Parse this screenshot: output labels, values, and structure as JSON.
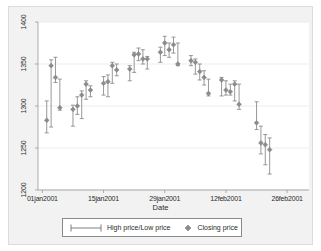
{
  "chart_data": {
    "type": "line",
    "title": "",
    "xlabel": "Date",
    "ylabel": "",
    "ylim": [
      1200,
      1400
    ],
    "yticks": [
      1200,
      1250,
      1300,
      1350,
      1400
    ],
    "xticks": [
      "01jan2001",
      "15jan2001",
      "29jan2001",
      "12feb2001",
      "26feb2001"
    ],
    "xtick_days": [
      0,
      14,
      28,
      42,
      56
    ],
    "xlim_days": [
      -1,
      61
    ],
    "grid": "horizontal",
    "legend_position": "bottom",
    "series": [
      {
        "name": "High price/Low price",
        "type": "range-bar",
        "color": "#8c8c8c",
        "marker": "capped-line"
      },
      {
        "name": "Closing price",
        "type": "marker",
        "color": "#8c8c8c",
        "marker": "diamond"
      }
    ],
    "points": [
      {
        "day": 1,
        "date": "02jan2001",
        "high": 1306,
        "low": 1268,
        "close": 1283
      },
      {
        "day": 2,
        "date": "03jan2001",
        "high": 1355,
        "low": 1275,
        "close": 1348
      },
      {
        "day": 3,
        "date": "04jan2001",
        "high": 1358,
        "low": 1328,
        "close": 1334
      },
      {
        "day": 4,
        "date": "05jan2001",
        "high": 1332,
        "low": 1295,
        "close": 1298
      },
      {
        "day": 7,
        "date": "08jan2001",
        "high": 1301,
        "low": 1276,
        "close": 1296
      },
      {
        "day": 8,
        "date": "09jan2001",
        "high": 1311,
        "low": 1290,
        "close": 1300
      },
      {
        "day": 9,
        "date": "10jan2001",
        "high": 1318,
        "low": 1285,
        "close": 1313
      },
      {
        "day": 10,
        "date": "11jan2001",
        "high": 1330,
        "low": 1308,
        "close": 1326
      },
      {
        "day": 11,
        "date": "12jan2001",
        "high": 1324,
        "low": 1311,
        "close": 1319
      },
      {
        "day": 14,
        "date": "16jan2001",
        "high": 1335,
        "low": 1313,
        "close": 1327
      },
      {
        "day": 15,
        "date": "17jan2001",
        "high": 1337,
        "low": 1311,
        "close": 1329
      },
      {
        "day": 16,
        "date": "18jan2001",
        "high": 1352,
        "low": 1327,
        "close": 1348
      },
      {
        "day": 17,
        "date": "19jan2001",
        "high": 1350,
        "low": 1336,
        "close": 1343
      },
      {
        "day": 20,
        "date": "22jan2001",
        "high": 1348,
        "low": 1330,
        "close": 1344
      },
      {
        "day": 21,
        "date": "23jan2001",
        "high": 1364,
        "low": 1340,
        "close": 1361
      },
      {
        "day": 22,
        "date": "24jan2001",
        "high": 1369,
        "low": 1354,
        "close": 1362
      },
      {
        "day": 23,
        "date": "25jan2001",
        "high": 1367,
        "low": 1350,
        "close": 1356
      },
      {
        "day": 24,
        "date": "26jan2001",
        "high": 1359,
        "low": 1344,
        "close": 1356
      },
      {
        "day": 27,
        "date": "29jan2001",
        "high": 1370,
        "low": 1352,
        "close": 1364
      },
      {
        "day": 28,
        "date": "30jan2001",
        "high": 1383,
        "low": 1360,
        "close": 1375
      },
      {
        "day": 29,
        "date": "31jan2001",
        "high": 1375,
        "low": 1358,
        "close": 1367
      },
      {
        "day": 30,
        "date": "01feb2001",
        "high": 1382,
        "low": 1363,
        "close": 1373
      },
      {
        "day": 31,
        "date": "02feb2001",
        "high": 1375,
        "low": 1348,
        "close": 1350
      },
      {
        "day": 34,
        "date": "05feb2001",
        "high": 1360,
        "low": 1348,
        "close": 1354
      },
      {
        "day": 35,
        "date": "06feb2001",
        "high": 1356,
        "low": 1338,
        "close": 1352
      },
      {
        "day": 36,
        "date": "07feb2001",
        "high": 1350,
        "low": 1331,
        "close": 1341
      },
      {
        "day": 37,
        "date": "08feb2001",
        "high": 1342,
        "low": 1325,
        "close": 1334
      },
      {
        "day": 38,
        "date": "09feb2001",
        "high": 1332,
        "low": 1312,
        "close": 1315
      },
      {
        "day": 41,
        "date": "12feb2001",
        "high": 1334,
        "low": 1312,
        "close": 1331
      },
      {
        "day": 42,
        "date": "13feb2001",
        "high": 1330,
        "low": 1313,
        "close": 1319
      },
      {
        "day": 43,
        "date": "14feb2001",
        "high": 1326,
        "low": 1313,
        "close": 1317
      },
      {
        "day": 44,
        "date": "15feb2001",
        "high": 1330,
        "low": 1306,
        "close": 1326
      },
      {
        "day": 45,
        "date": "16feb2001",
        "high": 1326,
        "low": 1296,
        "close": 1302
      },
      {
        "day": 49,
        "date": "20feb2001",
        "high": 1305,
        "low": 1272,
        "close": 1280
      },
      {
        "day": 50,
        "date": "21feb2001",
        "high": 1276,
        "low": 1243,
        "close": 1256
      },
      {
        "day": 51,
        "date": "22feb2001",
        "high": 1266,
        "low": 1230,
        "close": 1254
      },
      {
        "day": 52,
        "date": "23feb2001",
        "high": 1262,
        "low": 1219,
        "close": 1248
      }
    ]
  },
  "axes": {
    "ylabels": [
      "1200",
      "1250",
      "1300",
      "1350",
      "1400"
    ],
    "xlabels": [
      "01jan2001",
      "15jan2001",
      "29jan2001",
      "12feb2001",
      "26feb2001"
    ],
    "xtitle": "Date"
  },
  "legend": {
    "entries": [
      {
        "label": "High price/Low price",
        "key": "capped-line-key"
      },
      {
        "label": "Closing price",
        "key": "diamond-key"
      }
    ]
  },
  "colors": {
    "data": "#8c8c8c",
    "grid": "#e8e8e8",
    "axis": "#9a9a9a",
    "background": "#f2f2f2",
    "plot_background": "#ffffff",
    "text": "#2b2b2b"
  }
}
